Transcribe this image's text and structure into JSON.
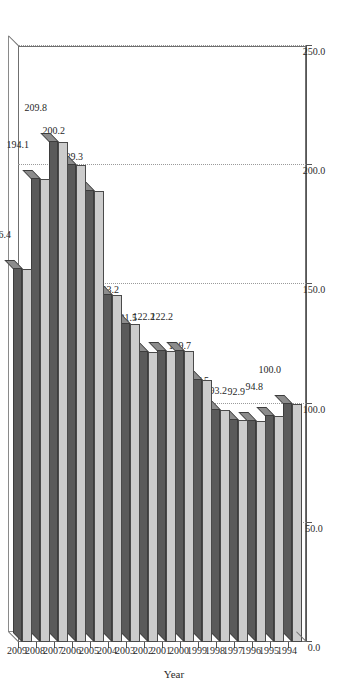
{
  "chart_data": {
    "type": "bar",
    "orientation": "horizontal",
    "title": "",
    "xlabel": "",
    "ylabel": "Year",
    "categories": [
      "1994",
      "1995",
      "1996",
      "1997",
      "1998",
      "1999",
      "2000",
      "2001",
      "2002",
      "2003",
      "2004",
      "2005",
      "2006",
      "2007",
      "2008",
      "2009"
    ],
    "values": [
      100.0,
      94.8,
      92.9,
      93.2,
      97.5,
      109.7,
      122.2,
      122.2,
      121.5,
      133.2,
      145.5,
      189.3,
      200.2,
      209.8,
      194.1,
      156.4
    ],
    "data_labels": [
      "100.0",
      "94.8",
      "92.9",
      "93.2",
      "97.5",
      "109.7",
      "122.2",
      "122.2",
      "121.5",
      "133.2",
      "145.5",
      "189.3",
      "200.2",
      "209.8",
      "194.1",
      "156.4"
    ],
    "value_axis_ticks": [
      "0.0",
      "50.0",
      "100.0",
      "150.0",
      "200.0",
      "250.0"
    ],
    "value_axis_tick_values": [
      0,
      50,
      100,
      150,
      200,
      250
    ],
    "xlim": [
      0,
      250
    ],
    "grid": true,
    "legend": "none",
    "style": "3d",
    "colors": {
      "bar_face": "#cccccc",
      "bar_shade": "#5a5a5a",
      "grid": "#9a9a9a",
      "axis": "#555555",
      "text": "#2b2b2b",
      "background": "#ffffff"
    }
  },
  "axis": {
    "category_title": "Year"
  }
}
